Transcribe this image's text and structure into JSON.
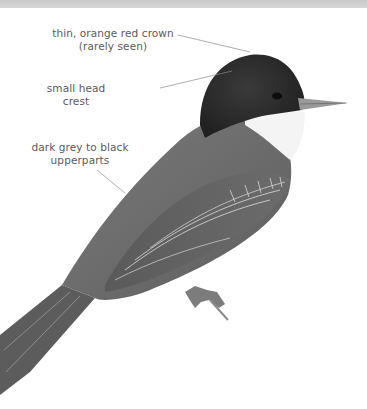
{
  "page": {
    "top_band_color": "#cfcfcf",
    "background_color": "#ffffff"
  },
  "annotations": [
    {
      "id": "crown",
      "lines": [
        "thin, orange red crown",
        "(rarely seen)"
      ]
    },
    {
      "id": "crest",
      "lines": [
        "small head crest"
      ]
    },
    {
      "id": "upperparts",
      "lines": [
        "dark grey to black",
        "upperparts"
      ]
    }
  ],
  "colors": {
    "label_text": "#5a5a5a",
    "leader_line": "#8a8a8a",
    "head": "#2e2e2e",
    "body": "#6e6e6e",
    "wing": "#5a5a5a",
    "throat": "#f4f4f4",
    "bill": "#9a9a9a"
  }
}
